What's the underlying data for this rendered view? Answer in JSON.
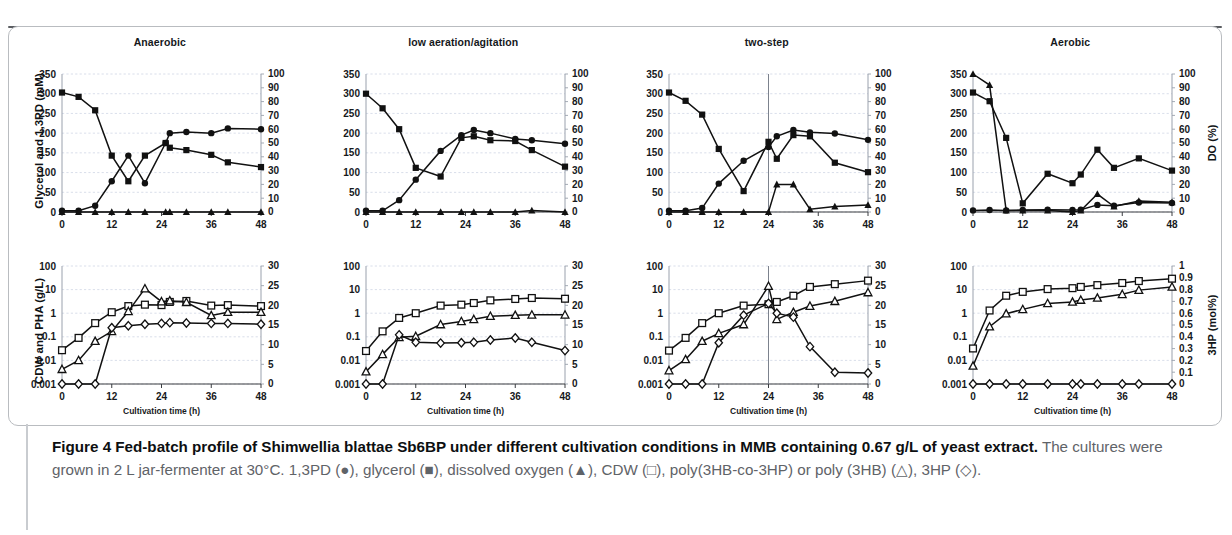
{
  "figure": {
    "frame_color": "#b9bcc0",
    "ink": "#111111",
    "grid_color": "#cfd6e4"
  },
  "panels": [
    {
      "id": "anaerobic",
      "title": "Anaerobic"
    },
    {
      "id": "low-aeration",
      "title": "low aeration/agitation"
    },
    {
      "id": "two-step",
      "title": "two-step"
    },
    {
      "id": "aerobic",
      "title": "Aerobic"
    }
  ],
  "axes": {
    "x_label": "Cultivation time (h)",
    "x_ticks": [
      "0",
      "12",
      "24",
      "36",
      "48"
    ],
    "top_left_title": "Glycerol and 1,3PD (mM)",
    "top_left_ticks": [
      "350",
      "300",
      "250",
      "200",
      "150",
      "100",
      "50",
      "0"
    ],
    "top_right_title": "DO (%)",
    "top_right_ticks": [
      "100",
      "90",
      "80",
      "70",
      "60",
      "50",
      "40",
      "30",
      "20",
      "10",
      "0"
    ],
    "bottom_left_title": "CDW and PHA (g/L)",
    "bottom_left_ticks": [
      "100",
      "10",
      "1",
      "0.1",
      "0.01",
      "0.001"
    ],
    "bottom_right_title_cdw": "",
    "bottom_right_ticks_pha": [
      "30",
      "25",
      "20",
      "15",
      "10",
      "5",
      "0"
    ],
    "bottom_right_title_3hp": "3HP (mol%)",
    "bottom_right_ticks_3hp": [
      "1",
      "0.9",
      "0.8",
      "0.7",
      "0.6",
      "0.5",
      "0.4",
      "0.3",
      "0.2",
      "0.1",
      "0"
    ]
  },
  "caption": {
    "bold_lead": "Figure 4 Fed-batch profile of Shimwellia blattae Sb6BP under different cultivation conditions in MMB containing 0.67 g/L of yeast extract.",
    "rest": " The cultures were grown in 2 L jar-fermenter at 30°C. 1,3PD (●), glycerol (■), dissolved oxygen (▲), CDW (□), poly(3HB-co-3HP) or poly (3HB) (△), 3HP (◇)."
  },
  "legend_symbols": {
    "1,3PD": "filled-circle",
    "glycerol": "filled-square",
    "dissolved_oxygen": "filled-triangle",
    "CDW": "open-square",
    "poly3HB": "open-triangle",
    "3HP": "open-diamond"
  },
  "chart_data": [
    {
      "type": "line",
      "panel": "Anaerobic",
      "row": "top",
      "title": "Anaerobic",
      "xlabel": "Cultivation time (h)",
      "ylabel": "Glycerol and 1,3PD (mM)",
      "y2label": "DO (%)",
      "xlim": [
        0,
        48
      ],
      "ylim": [
        0,
        350
      ],
      "y2lim": [
        0,
        100
      ],
      "grid": true,
      "series": [
        {
          "name": "glycerol",
          "axis": "left",
          "marker": "filled-square",
          "x": [
            0,
            4,
            8,
            12,
            16,
            20,
            25,
            26,
            30,
            36,
            40,
            48
          ],
          "y": [
            303,
            292,
            258,
            143,
            78,
            143,
            175,
            163,
            157,
            145,
            126,
            114
          ]
        },
        {
          "name": "1,3PD",
          "axis": "left",
          "marker": "filled-circle",
          "x": [
            0,
            4,
            8,
            12,
            16,
            20,
            25,
            26,
            30,
            36,
            40,
            48
          ],
          "y": [
            3,
            3,
            16,
            78,
            143,
            73,
            175,
            200,
            203,
            200,
            212,
            210
          ]
        },
        {
          "name": "dissolved oxygen",
          "axis": "right",
          "marker": "filled-triangle",
          "x": [
            0,
            4,
            8,
            12,
            16,
            20,
            25,
            26,
            30,
            36,
            40,
            48
          ],
          "y": [
            0,
            0,
            0,
            0,
            0,
            0,
            0,
            0,
            0,
            0,
            0,
            0
          ]
        }
      ]
    },
    {
      "type": "line",
      "panel": "Anaerobic",
      "row": "bottom",
      "xlabel": "Cultivation time (h)",
      "ylabel": "CDW and PHA (g/L)",
      "y2label": "3HP (mol%)",
      "xlim": [
        0,
        48
      ],
      "ylog": [
        0.001,
        100
      ],
      "y2lim": [
        0,
        30
      ],
      "grid": true,
      "series": [
        {
          "name": "CDW",
          "axis": "left-log",
          "marker": "open-square",
          "x": [
            0,
            4,
            8,
            12,
            16,
            20,
            24,
            26,
            30,
            36,
            40,
            48
          ],
          "y": [
            0.027,
            0.09,
            0.38,
            1.1,
            2.0,
            2.3,
            2.2,
            3.0,
            3.3,
            2.1,
            2.2,
            2.0
          ]
        },
        {
          "name": "poly(3HB-co-3HP)",
          "axis": "left-log",
          "marker": "open-triangle",
          "x": [
            0,
            4,
            8,
            12,
            16,
            20,
            24,
            26,
            30,
            36,
            40,
            48
          ],
          "y": [
            0.0042,
            0.01,
            0.065,
            0.17,
            1.2,
            11.0,
            3.1,
            3.4,
            2.9,
            0.8,
            1.1,
            1.1
          ]
        },
        {
          "name": "3HP",
          "axis": "right",
          "marker": "open-diamond",
          "x": [
            0,
            4,
            8,
            12,
            16,
            20,
            24,
            26,
            30,
            36,
            40,
            48
          ],
          "y": [
            0,
            0,
            0,
            14.3,
            14.8,
            15.2,
            15.4,
            15.6,
            15.5,
            15.4,
            15.4,
            15.2
          ]
        }
      ]
    },
    {
      "type": "line",
      "panel": "low aeration/agitation",
      "row": "top",
      "xlabel": "Cultivation time (h)",
      "ylabel": "Glycerol and 1,3PD (mM)",
      "y2label": "DO (%)",
      "xlim": [
        0,
        48
      ],
      "ylim": [
        0,
        350
      ],
      "y2lim": [
        0,
        100
      ],
      "grid": true,
      "series": [
        {
          "name": "glycerol",
          "axis": "left",
          "marker": "filled-square",
          "x": [
            0,
            4,
            8,
            12,
            18,
            23,
            26,
            30,
            36,
            40,
            48
          ],
          "y": [
            300,
            263,
            210,
            112,
            90,
            188,
            192,
            182,
            180,
            157,
            115
          ]
        },
        {
          "name": "1,3PD",
          "axis": "left",
          "marker": "filled-circle",
          "x": [
            0,
            4,
            8,
            12,
            18,
            23,
            26,
            30,
            36,
            40,
            48
          ],
          "y": [
            3,
            3,
            30,
            82,
            155,
            195,
            208,
            200,
            185,
            182,
            173
          ]
        },
        {
          "name": "dissolved oxygen",
          "axis": "right",
          "marker": "filled-triangle",
          "x": [
            0,
            4,
            8,
            12,
            18,
            23,
            26,
            30,
            36,
            40,
            48
          ],
          "y": [
            0,
            0,
            0,
            0,
            0,
            0,
            0,
            0,
            0,
            1,
            0
          ]
        }
      ]
    },
    {
      "type": "line",
      "panel": "low aeration/agitation",
      "row": "bottom",
      "xlabel": "Cultivation time (h)",
      "ylabel": "CDW and PHA (g/L)",
      "y2label": "3HP (mol%)",
      "xlim": [
        0,
        48
      ],
      "ylog": [
        0.001,
        100
      ],
      "y2lim": [
        0,
        30
      ],
      "grid": true,
      "series": [
        {
          "name": "CDW",
          "axis": "left-log",
          "marker": "open-square",
          "x": [
            0,
            4,
            8,
            12,
            18,
            23,
            26,
            30,
            36,
            40,
            48
          ],
          "y": [
            0.025,
            0.17,
            0.63,
            1.0,
            2.1,
            2.3,
            2.7,
            3.5,
            4.0,
            4.4,
            4.1
          ]
        },
        {
          "name": "poly(3HB-co-3HP)",
          "axis": "left-log",
          "marker": "open-triangle",
          "x": [
            0,
            4,
            8,
            12,
            18,
            23,
            26,
            30,
            36,
            40,
            48
          ],
          "y": [
            0.0033,
            0.018,
            0.095,
            0.105,
            0.33,
            0.45,
            0.55,
            0.75,
            0.82,
            0.85,
            0.85
          ]
        },
        {
          "name": "3HP",
          "axis": "right",
          "marker": "open-diamond",
          "x": [
            0,
            4,
            8,
            12,
            18,
            23,
            26,
            30,
            36,
            40,
            48
          ],
          "y": [
            0,
            0,
            12.5,
            10.6,
            10.4,
            10.5,
            10.6,
            11.2,
            11.7,
            10.6,
            8.5
          ]
        }
      ]
    },
    {
      "type": "line",
      "panel": "two-step",
      "row": "top",
      "xlabel": "Cultivation time (h)",
      "ylabel": "Glycerol and 1,3PD (mM)",
      "y2label": "DO (%)",
      "xlim": [
        0,
        48
      ],
      "ylim": [
        0,
        350
      ],
      "y2lim": [
        0,
        100
      ],
      "grid": true,
      "switch_marker_x": 24,
      "series": [
        {
          "name": "glycerol",
          "axis": "left",
          "marker": "filled-square",
          "x": [
            0,
            4,
            8,
            12,
            18,
            24,
            26,
            30,
            34,
            40,
            48
          ],
          "y": [
            303,
            282,
            247,
            160,
            53,
            178,
            135,
            195,
            192,
            125,
            101
          ]
        },
        {
          "name": "1,3PD",
          "axis": "left",
          "marker": "filled-circle",
          "x": [
            0,
            4,
            8,
            12,
            18,
            24,
            26,
            30,
            34,
            40,
            48
          ],
          "y": [
            3,
            3,
            10,
            72,
            130,
            165,
            192,
            208,
            202,
            199,
            183
          ]
        },
        {
          "name": "dissolved oxygen",
          "axis": "right",
          "marker": "filled-triangle",
          "x": [
            0,
            4,
            8,
            12,
            18,
            24,
            26,
            30,
            34,
            40,
            48
          ],
          "y": [
            0,
            0,
            0,
            0,
            0,
            0,
            20,
            20,
            2,
            4,
            5
          ]
        }
      ]
    },
    {
      "type": "line",
      "panel": "two-step",
      "row": "bottom",
      "xlabel": "Cultivation time (h)",
      "ylabel": "CDW and PHA (g/L)",
      "y2label": "3HP (mol%)",
      "xlim": [
        0,
        48
      ],
      "ylog": [
        0.001,
        100
      ],
      "y2lim": [
        0,
        30
      ],
      "grid": true,
      "switch_marker_x": 24,
      "series": [
        {
          "name": "CDW",
          "axis": "left-log",
          "marker": "open-square",
          "x": [
            0,
            4,
            8,
            12,
            18,
            24,
            26,
            30,
            34,
            40,
            48
          ],
          "y": [
            0.026,
            0.09,
            0.38,
            1.0,
            2.1,
            2.4,
            3.0,
            5.5,
            13.0,
            17.0,
            24.0
          ]
        },
        {
          "name": "poly(3HB-co-3HP)",
          "axis": "left-log",
          "marker": "open-triangle",
          "x": [
            0,
            4,
            8,
            12,
            18,
            24,
            26,
            30,
            34,
            40,
            48
          ],
          "y": [
            0.0037,
            0.011,
            0.065,
            0.14,
            0.33,
            14.0,
            0.55,
            1.1,
            2.0,
            3.2,
            7.5
          ]
        },
        {
          "name": "3HP",
          "axis": "right",
          "marker": "open-diamond",
          "x": [
            0,
            4,
            8,
            12,
            18,
            24,
            26,
            30,
            34,
            40,
            48
          ],
          "y": [
            0,
            0,
            0,
            10.5,
            17.5,
            20.5,
            18.0,
            17.0,
            9.5,
            3.0,
            2.8
          ]
        }
      ]
    },
    {
      "type": "line",
      "panel": "Aerobic",
      "row": "top",
      "xlabel": "Cultivation time (h)",
      "ylabel": "Glycerol and 1,3PD (mM)",
      "y2label": "DO (%)",
      "xlim": [
        0,
        48
      ],
      "ylim": [
        0,
        350
      ],
      "y2lim": [
        0,
        100
      ],
      "grid": true,
      "series": [
        {
          "name": "glycerol",
          "axis": "left",
          "marker": "filled-square",
          "x": [
            0,
            4,
            8,
            12,
            18,
            24,
            26,
            30,
            34,
            40,
            48
          ],
          "y": [
            303,
            281,
            188,
            22,
            97,
            73,
            95,
            158,
            112,
            136,
            105
          ]
        },
        {
          "name": "1,3PD",
          "axis": "left",
          "marker": "filled-circle",
          "x": [
            0,
            4,
            8,
            12,
            18,
            24,
            26,
            30,
            34,
            40,
            48
          ],
          "y": [
            4,
            5,
            4,
            5,
            6,
            5,
            6,
            18,
            16,
            24,
            23
          ]
        },
        {
          "name": "dissolved oxygen",
          "axis": "right",
          "marker": "filled-triangle",
          "x": [
            0,
            4,
            8,
            12,
            18,
            24,
            26,
            30,
            34,
            40,
            48
          ],
          "y": [
            100,
            92,
            1,
            1,
            1,
            0,
            1,
            13,
            4,
            8,
            7
          ]
        }
      ]
    },
    {
      "type": "line",
      "panel": "Aerobic",
      "row": "bottom",
      "xlabel": "Cultivation time (h)",
      "ylabel": "CDW and PHA (g/L)",
      "y2label": "3HP (mol%)",
      "xlim": [
        0,
        48
      ],
      "ylog": [
        0.001,
        100
      ],
      "y2lim": [
        0,
        1
      ],
      "grid": true,
      "series": [
        {
          "name": "CDW",
          "axis": "left-log",
          "marker": "open-square",
          "x": [
            0,
            4,
            8,
            12,
            18,
            24,
            26,
            30,
            36,
            40,
            48
          ],
          "y": [
            0.032,
            1.3,
            5.5,
            8.0,
            10.5,
            11.5,
            13.0,
            15.5,
            19.0,
            23.0,
            29.0
          ]
        },
        {
          "name": "poly(3HB)",
          "axis": "left-log",
          "marker": "open-triangle",
          "x": [
            0,
            4,
            8,
            12,
            18,
            24,
            26,
            30,
            36,
            40,
            48
          ],
          "y": [
            0.0058,
            0.27,
            0.95,
            1.45,
            2.6,
            3.0,
            3.6,
            4.4,
            6.3,
            9.5,
            13.0
          ]
        },
        {
          "name": "3HP",
          "axis": "right",
          "marker": "open-diamond",
          "x": [
            0,
            4,
            8,
            12,
            18,
            24,
            26,
            30,
            36,
            40,
            48
          ],
          "y": [
            0,
            0,
            0,
            0,
            0,
            0,
            0,
            0,
            0,
            0,
            0
          ]
        }
      ]
    }
  ]
}
